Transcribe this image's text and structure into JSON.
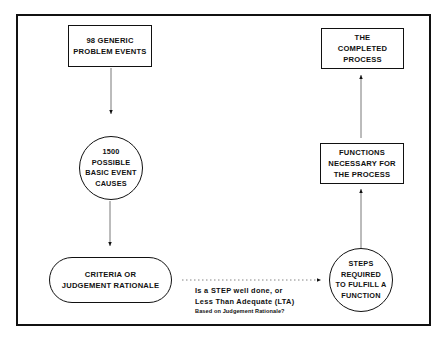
{
  "diagram": {
    "nodes": {
      "generic_events": {
        "lines": [
          "98 GENERIC",
          "PROBLEM EVENTS"
        ],
        "shape": "rectangle"
      },
      "basic_causes": {
        "lines": [
          "1500",
          "POSSIBLE",
          "BASIC EVENT",
          "CAUSES"
        ],
        "shape": "circle"
      },
      "criteria": {
        "lines": [
          "CRITERIA OR",
          "JUDGEMENT RATIONALE"
        ],
        "shape": "rounded-rectangle"
      },
      "steps": {
        "lines": [
          "STEPS",
          "REQUIRED",
          "TO FULFILL A",
          "FUNCTION"
        ],
        "shape": "circle"
      },
      "functions": {
        "lines": [
          "FUNCTIONS",
          "NECESSARY FOR",
          "THE PROCESS"
        ],
        "shape": "rectangle"
      },
      "completed": {
        "lines": [
          "THE",
          "COMPLETED",
          "PROCESS"
        ],
        "shape": "rectangle"
      }
    },
    "edge_label": {
      "line1": "Is a STEP well done, or",
      "line2": "Less Than Adequate (LTA)",
      "line3": "Based on Judgement Rationale?"
    },
    "edges": [
      {
        "from": "generic_events",
        "to": "basic_causes",
        "style": "solid"
      },
      {
        "from": "basic_causes",
        "to": "criteria",
        "style": "solid"
      },
      {
        "from": "criteria",
        "to": "steps",
        "style": "dotted"
      },
      {
        "from": "steps",
        "to": "functions",
        "style": "solid"
      },
      {
        "from": "functions",
        "to": "completed",
        "style": "solid"
      }
    ],
    "colors": {
      "ink": "#111111",
      "background": "#ffffff"
    }
  }
}
